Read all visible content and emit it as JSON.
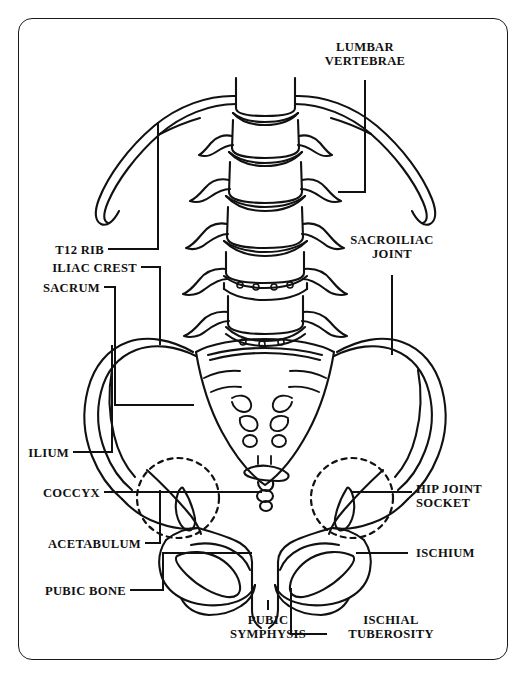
{
  "figure": {
    "style": "black-and-white line drawing with rounded rectangular border",
    "border_color": "#1a1a1a",
    "ink_color": "#111111",
    "background_color": "#ffffff"
  },
  "labels": {
    "lumbar_vertebrae": "LUMBAR\nVERTEBRAE",
    "sacroiliac_joint": "SACROILIAC\nJOINT",
    "t12_rib": "T12 RIB",
    "iliac_crest": "ILIAC CREST",
    "sacrum": "SACRUM",
    "ilium": "ILIUM",
    "coccyx": "COCCYX",
    "acetabulum": "ACETABULUM",
    "pubic_bone": "PUBIC BONE",
    "hip_joint_socket": "HIP JOINT\nSOCKET",
    "ischium": "ISCHIUM",
    "pubic_symphysis": "PUBIC\nSYMPHYSIS",
    "ischial_tuberosity": "ISCHIAL\nTUBEROSITY"
  },
  "structures": [
    {
      "name": "lumbar-vertebrae",
      "count": 5,
      "side": "center"
    },
    {
      "name": "t12-rib",
      "count": 2,
      "side": "both"
    },
    {
      "name": "sacrum",
      "count": 1,
      "side": "center"
    },
    {
      "name": "coccyx",
      "count": 1,
      "side": "center"
    },
    {
      "name": "ilium",
      "count": 2,
      "side": "both"
    },
    {
      "name": "iliac-crest",
      "count": 2,
      "side": "both"
    },
    {
      "name": "acetabulum",
      "count": 2,
      "side": "both"
    },
    {
      "name": "ischium",
      "count": 2,
      "side": "both"
    },
    {
      "name": "pubic-bone",
      "count": 2,
      "side": "both"
    },
    {
      "name": "obturator-foramen",
      "count": 2,
      "side": "both"
    },
    {
      "name": "pubic-symphysis",
      "count": 1,
      "side": "center"
    },
    {
      "name": "ischial-tuberosity",
      "count": 2,
      "side": "both"
    },
    {
      "name": "sacroiliac-joint",
      "count": 2,
      "side": "both"
    }
  ]
}
